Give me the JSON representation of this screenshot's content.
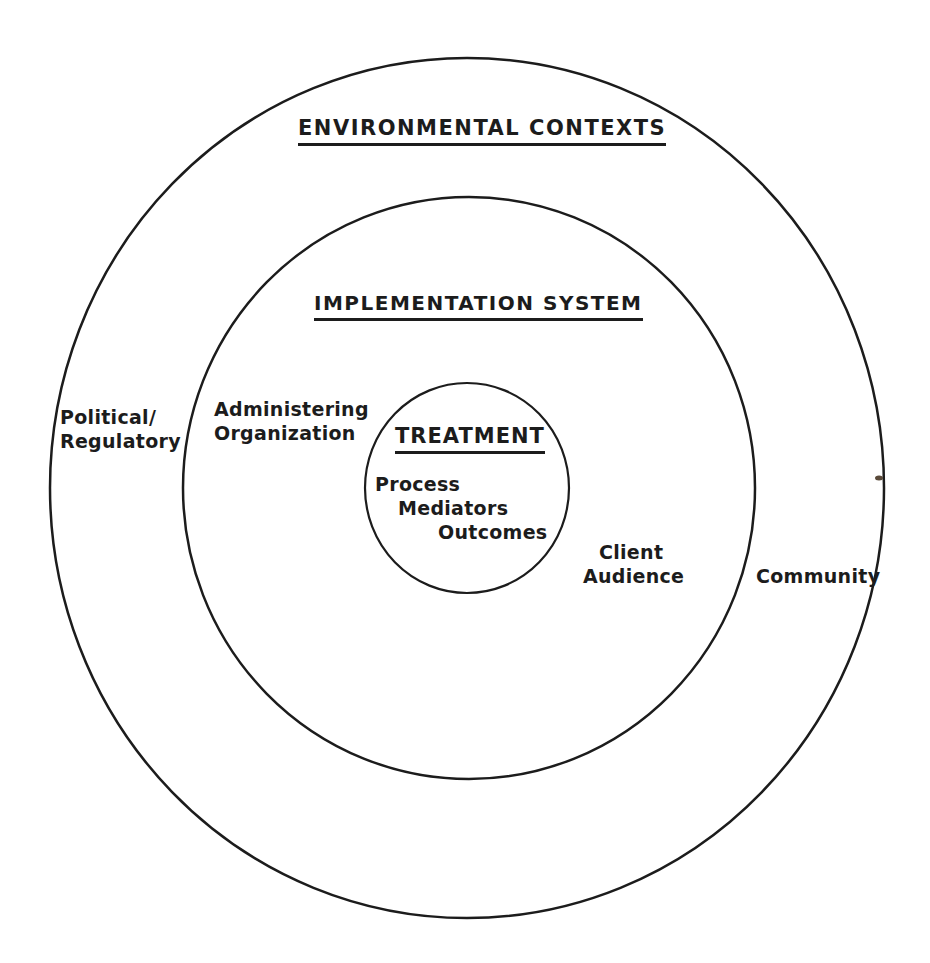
{
  "diagram": {
    "type": "concentric-circles",
    "outer_ring": {
      "heading": "ENVIRONMENTAL CONTEXTS",
      "labels": {
        "left": [
          "Political/",
          "Regulatory"
        ],
        "right": [
          "Community"
        ]
      }
    },
    "middle_ring": {
      "heading": "IMPLEMENTATION SYSTEM",
      "labels": {
        "left": [
          "Administering",
          "Organization"
        ],
        "right": [
          "Client",
          "Audience"
        ]
      }
    },
    "inner_circle": {
      "heading": "TREATMENT",
      "items": [
        "Process",
        "Mediators",
        "Outcomes"
      ]
    },
    "colors": {
      "line": "#1c1c1c",
      "background": "#ffffff"
    }
  }
}
